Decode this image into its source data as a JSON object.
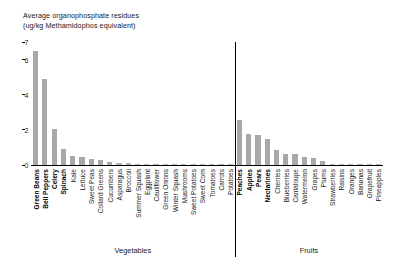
{
  "chart": {
    "title_line1": "Average organophosphate residues",
    "title_line2": "(ug/kg Methamidophos equivalent)",
    "group_labels": {
      "vegetables": "Vegetables",
      "fruits": "Fruits"
    },
    "y_ticks": [
      "0",
      "2",
      "4",
      "6",
      "7"
    ],
    "bar_color": "#a8a8a8",
    "axis_color": "#000000"
  },
  "chart_data": {
    "type": "bar",
    "title": "Average organophosphate residues (ug/kg Methamidophos equivalent)",
    "xlabel": "",
    "ylabel": "ug/kg Methamidophos equivalent",
    "ylim": [
      0,
      7
    ],
    "yticks": [
      0,
      2,
      4,
      6,
      7
    ],
    "grid": false,
    "legend": "none",
    "groups": [
      {
        "name": "Vegetables",
        "categories": [
          "Green Beans",
          "Bell Peppers",
          "Celery",
          "Spinach",
          "Kale",
          "Lettuce",
          "Sweet Peas",
          "Collard Greens",
          "Cucumbers",
          "Asparagus",
          "Broccoli",
          "Summer Squash",
          "Eggplant",
          "Cauliflower",
          "Green Onions",
          "Winter Squash",
          "Mushrooms",
          "Sweet Potatoes",
          "Sweet Corn",
          "Tomatoes",
          "Carrots",
          "Potatoes"
        ],
        "values": [
          6.5,
          4.9,
          2.05,
          0.93,
          0.5,
          0.48,
          0.35,
          0.3,
          0.2,
          0.12,
          0.1,
          0.08,
          0.06,
          0.05,
          0.04,
          0.03,
          0.03,
          0.02,
          0.02,
          0.02,
          0.01,
          0.01
        ],
        "highlighted": [
          "Green Beans",
          "Bell Peppers",
          "Celery",
          "Spinach"
        ]
      },
      {
        "name": "Fruits",
        "categories": [
          "Peaches",
          "Apples",
          "Pears",
          "Nectarines",
          "Cherries",
          "Blueberries",
          "Cantaloupe",
          "Watermelon",
          "Grapes",
          "Plums",
          "Strawberries",
          "Raisins",
          "Oranges",
          "Bananas",
          "Grapefruit",
          "Pineapples"
        ],
        "values": [
          2.55,
          1.75,
          1.7,
          1.5,
          0.85,
          0.65,
          0.62,
          0.45,
          0.42,
          0.22,
          0.08,
          0.05,
          0.02,
          0.02,
          0.01,
          0.01
        ],
        "highlighted": [
          "Peaches",
          "Apples",
          "Pears",
          "Nectarines"
        ]
      }
    ],
    "categories": [
      "Green Beans",
      "Bell Peppers",
      "Celery",
      "Spinach",
      "Kale",
      "Lettuce",
      "Sweet Peas",
      "Collard Greens",
      "Cucumbers",
      "Asparagus",
      "Broccoli",
      "Summer Squash",
      "Eggplant",
      "Cauliflower",
      "Green Onions",
      "Winter Squash",
      "Mushrooms",
      "Sweet Potatoes",
      "Sweet Corn",
      "Tomatoes",
      "Carrots",
      "Potatoes",
      "Peaches",
      "Apples",
      "Pears",
      "Nectarines",
      "Cherries",
      "Blueberries",
      "Cantaloupe",
      "Watermelon",
      "Grapes",
      "Plums",
      "Strawberries",
      "Raisins",
      "Oranges",
      "Bananas",
      "Grapefruit",
      "Pineapples"
    ],
    "values": [
      6.5,
      4.9,
      2.05,
      0.93,
      0.5,
      0.48,
      0.35,
      0.3,
      0.2,
      0.12,
      0.1,
      0.08,
      0.06,
      0.05,
      0.04,
      0.03,
      0.03,
      0.02,
      0.02,
      0.02,
      0.01,
      0.01,
      2.55,
      1.75,
      1.7,
      1.5,
      0.85,
      0.65,
      0.62,
      0.45,
      0.42,
      0.22,
      0.08,
      0.05,
      0.02,
      0.02,
      0.01,
      0.01
    ]
  }
}
